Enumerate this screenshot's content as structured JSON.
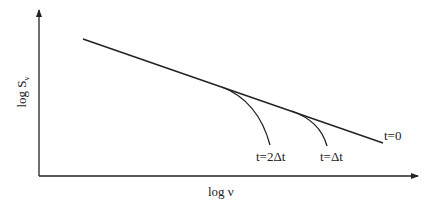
{
  "diagram": {
    "type": "log-log schematic",
    "x_axis": {
      "label": "log ν"
    },
    "y_axis": {
      "label_main": "log S",
      "label_sub": "ν"
    },
    "curves": [
      {
        "id": "t0",
        "label": "t=0"
      },
      {
        "id": "t1",
        "label": "t=Δt"
      },
      {
        "id": "t2",
        "label": "t=2Δt"
      }
    ],
    "colors": {
      "stroke": "#222222",
      "background": "#ffffff"
    }
  }
}
